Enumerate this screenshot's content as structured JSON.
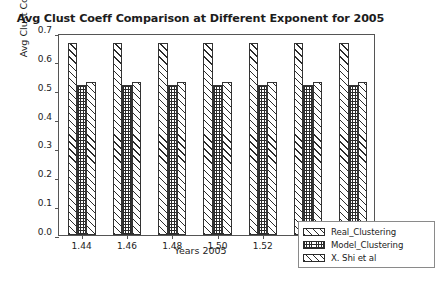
{
  "chart_data": {
    "type": "bar",
    "title": "Avg Clust Coeff Comparison at Different Exponent for 2005",
    "xlabel": "Years 2005",
    "ylabel": "Avg Clust Coeff",
    "categories": [
      "1.44",
      "1.46",
      "1.48",
      "1.50",
      "1.52",
      "1.54",
      "1.56"
    ],
    "series": [
      {
        "name": "Real_Clustering",
        "hatch": "diagonal",
        "values": [
          0.665,
          0.665,
          0.665,
          0.665,
          0.665,
          0.665,
          0.665
        ]
      },
      {
        "name": "Model_Clustering",
        "hatch": "grid",
        "values": [
          0.52,
          0.52,
          0.52,
          0.52,
          0.52,
          0.52,
          0.52
        ]
      },
      {
        "name": "X. Shi et al",
        "hatch": "diagonal",
        "values": [
          0.53,
          0.53,
          0.53,
          0.53,
          0.53,
          0.53,
          0.53
        ]
      }
    ],
    "ylim": [
      0.0,
      0.7
    ],
    "yticks": [
      "0.0",
      "0.1",
      "0.2",
      "0.3",
      "0.4",
      "0.5",
      "0.6",
      "0.7"
    ],
    "xticks": [
      "1.44",
      "1.46",
      "1.48",
      "1.50",
      "1.52",
      "1.54",
      "1.56"
    ],
    "grid": false,
    "legend_position": "lower right",
    "colors": {
      "bar_edge": "#333333",
      "bar_face": "#ffffff",
      "hatch": "#2b2b2b",
      "axis": "#555555",
      "text": "#1c1c1c"
    }
  }
}
